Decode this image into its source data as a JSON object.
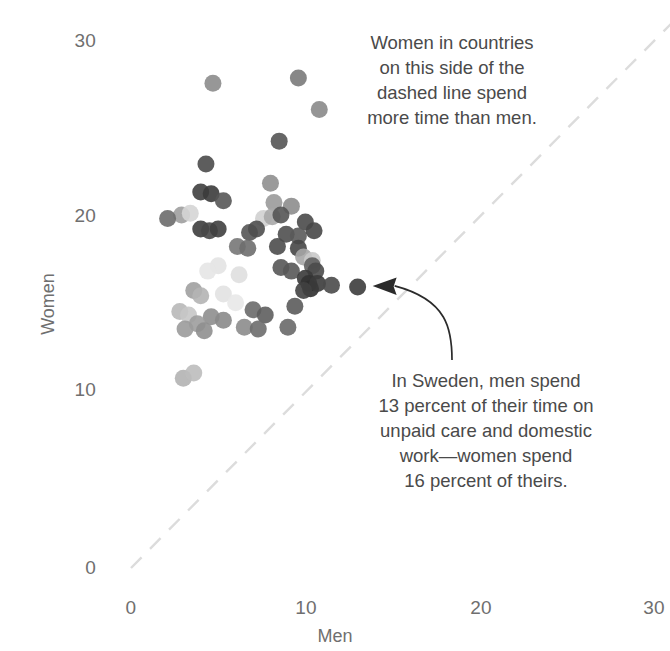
{
  "chart_data": {
    "type": "scatter",
    "title": "",
    "xlabel": "Men",
    "ylabel": "Women",
    "xlim": [
      0,
      31.5
    ],
    "ylim": [
      -0.7,
      31.5
    ],
    "xticks": [
      0,
      10,
      20,
      30
    ],
    "yticks": [
      0,
      10,
      20,
      30
    ],
    "xtick_labels": [
      "0",
      "10",
      "20",
      "30"
    ],
    "ytick_labels": [
      "0",
      "10",
      "20",
      "30"
    ],
    "grid": false,
    "legend": "none",
    "reference_line": {
      "name": "parity-line",
      "type": "dashed-diagonal",
      "equation": "y = x",
      "from": [
        0,
        0
      ],
      "to": [
        31.5,
        31.5
      ],
      "color": "#dcdcdc"
    },
    "annotations": [
      {
        "name": "above-line-note",
        "text": "Women in countries\non this side of the\ndashed line spend\nmore time than men."
      },
      {
        "name": "sweden-note",
        "text": "In Sweden, men spend\n13 percent of their time on\nunpaid care and domestic\nwork—women spend\n16 percent of theirs."
      }
    ],
    "callout": {
      "name": "sweden-callout-arrow",
      "target_point": [
        13.0,
        16.0
      ],
      "color": "#2b2b2b"
    },
    "marker": {
      "shape": "circle",
      "radius_px": 8.5,
      "opacity": 0.9
    },
    "points": [
      {
        "x": 4.7,
        "y": 27.6,
        "c": "#8c8c8c"
      },
      {
        "x": 9.6,
        "y": 27.9,
        "c": "#7a7a7a"
      },
      {
        "x": 10.8,
        "y": 26.1,
        "c": "#8a8a8a"
      },
      {
        "x": 8.5,
        "y": 24.3,
        "c": "#555555"
      },
      {
        "x": 4.3,
        "y": 23.0,
        "c": "#4b4b4b"
      },
      {
        "x": 8.0,
        "y": 21.9,
        "c": "#8f8f8f"
      },
      {
        "x": 4.0,
        "y": 21.4,
        "c": "#3f3f3f"
      },
      {
        "x": 4.6,
        "y": 21.3,
        "c": "#3b3b3b"
      },
      {
        "x": 8.2,
        "y": 20.8,
        "c": "#9a9a9a"
      },
      {
        "x": 9.2,
        "y": 20.6,
        "c": "#8d8d8d"
      },
      {
        "x": 5.3,
        "y": 20.9,
        "c": "#565656"
      },
      {
        "x": 2.9,
        "y": 20.1,
        "c": "#9f9f9f"
      },
      {
        "x": 3.4,
        "y": 20.2,
        "c": "#d5d5d5"
      },
      {
        "x": 2.1,
        "y": 19.9,
        "c": "#6b6b6b"
      },
      {
        "x": 7.6,
        "y": 19.9,
        "c": "#d0d0d0"
      },
      {
        "x": 8.1,
        "y": 20.0,
        "c": "#a8a8a8"
      },
      {
        "x": 8.6,
        "y": 20.1,
        "c": "#555555"
      },
      {
        "x": 10.0,
        "y": 19.7,
        "c": "#4a4a4a"
      },
      {
        "x": 4.0,
        "y": 19.3,
        "c": "#3d3d3d"
      },
      {
        "x": 4.5,
        "y": 19.2,
        "c": "#474747"
      },
      {
        "x": 5.0,
        "y": 19.3,
        "c": "#3f3f3f"
      },
      {
        "x": 6.8,
        "y": 19.1,
        "c": "#555555"
      },
      {
        "x": 7.2,
        "y": 19.3,
        "c": "#4e4e4e"
      },
      {
        "x": 8.9,
        "y": 19.0,
        "c": "#4f4f4f"
      },
      {
        "x": 9.6,
        "y": 18.9,
        "c": "#5a5a5a"
      },
      {
        "x": 10.5,
        "y": 19.2,
        "c": "#474747"
      },
      {
        "x": 8.4,
        "y": 18.3,
        "c": "#4c4c4c"
      },
      {
        "x": 9.6,
        "y": 18.2,
        "c": "#464646"
      },
      {
        "x": 6.1,
        "y": 18.3,
        "c": "#777777"
      },
      {
        "x": 6.7,
        "y": 18.2,
        "c": "#6e6e6e"
      },
      {
        "x": 9.9,
        "y": 17.7,
        "c": "#a6a6a6"
      },
      {
        "x": 10.4,
        "y": 17.5,
        "c": "#c9c9c9"
      },
      {
        "x": 10.4,
        "y": 17.2,
        "c": "#5f5f5f"
      },
      {
        "x": 10.6,
        "y": 16.9,
        "c": "#4b4b4b"
      },
      {
        "x": 5.0,
        "y": 17.2,
        "c": "#e3e3e3"
      },
      {
        "x": 4.4,
        "y": 16.9,
        "c": "#e6e6e6"
      },
      {
        "x": 6.2,
        "y": 16.7,
        "c": "#dfdfdf"
      },
      {
        "x": 8.6,
        "y": 17.1,
        "c": "#565656"
      },
      {
        "x": 9.2,
        "y": 16.9,
        "c": "#585858"
      },
      {
        "x": 10.0,
        "y": 16.5,
        "c": "#3a3a3a"
      },
      {
        "x": 10.2,
        "y": 16.2,
        "c": "#333333"
      },
      {
        "x": 10.3,
        "y": 15.9,
        "c": "#2f2f2f"
      },
      {
        "x": 10.7,
        "y": 16.2,
        "c": "#3b3b3b"
      },
      {
        "x": 9.9,
        "y": 15.8,
        "c": "#414141"
      },
      {
        "x": 11.5,
        "y": 16.1,
        "c": "#4a4a4a"
      },
      {
        "x": 13.0,
        "y": 16.0,
        "c": "#3c3c3c"
      },
      {
        "x": 3.6,
        "y": 15.8,
        "c": "#a0a0a0"
      },
      {
        "x": 4.0,
        "y": 15.5,
        "c": "#b4b4b4"
      },
      {
        "x": 5.3,
        "y": 15.6,
        "c": "#e2e2e2"
      },
      {
        "x": 6.0,
        "y": 15.1,
        "c": "#e8e8e8"
      },
      {
        "x": 2.8,
        "y": 14.6,
        "c": "#b8b8b8"
      },
      {
        "x": 3.3,
        "y": 14.4,
        "c": "#c6c6c6"
      },
      {
        "x": 4.6,
        "y": 14.3,
        "c": "#8e8e8e"
      },
      {
        "x": 5.3,
        "y": 14.1,
        "c": "#8a8a8a"
      },
      {
        "x": 7.0,
        "y": 14.7,
        "c": "#6a6a6a"
      },
      {
        "x": 7.7,
        "y": 14.4,
        "c": "#5e5e5e"
      },
      {
        "x": 9.4,
        "y": 14.9,
        "c": "#5b5b5b"
      },
      {
        "x": 3.8,
        "y": 13.9,
        "c": "#9d9d9d"
      },
      {
        "x": 3.1,
        "y": 13.6,
        "c": "#9b9b9b"
      },
      {
        "x": 4.2,
        "y": 13.5,
        "c": "#8f8f8f"
      },
      {
        "x": 6.5,
        "y": 13.7,
        "c": "#8c8c8c"
      },
      {
        "x": 7.3,
        "y": 13.6,
        "c": "#6d6d6d"
      },
      {
        "x": 9.0,
        "y": 13.7,
        "c": "#696969"
      },
      {
        "x": 3.0,
        "y": 10.8,
        "c": "#b3b3b3"
      },
      {
        "x": 3.6,
        "y": 11.1,
        "c": "#bdbdbd"
      }
    ]
  },
  "axes": {
    "x_title": "Men",
    "y_title": "Women",
    "x_ticks": [
      "0",
      "10",
      "20",
      "30"
    ],
    "y_ticks": [
      "30",
      "20",
      "10",
      "0"
    ]
  },
  "annotations": {
    "above_line": "Women in countries\non this side of the\ndashed line spend\nmore time than men.",
    "sweden": "In Sweden, men spend\n13 percent of their time on\nunpaid care and domestic\nwork—women spend\n16 percent of theirs."
  },
  "colors": {
    "background": "#ffffff",
    "tick_text": "#6f6f6f",
    "annotation_text": "#4a4a4a",
    "dashed_line": "#dcdcdc",
    "arrow": "#2b2b2b"
  }
}
